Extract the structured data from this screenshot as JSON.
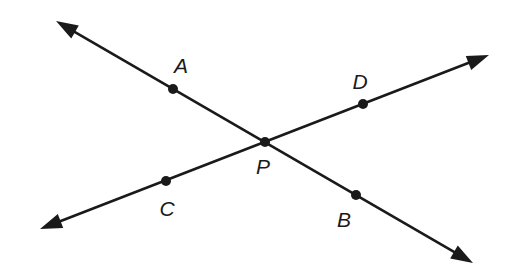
{
  "diagram": {
    "type": "intersecting-lines",
    "colors": {
      "line": "#1a1a1a",
      "background": "#ffffff"
    },
    "intersection": {
      "label": "P",
      "x": 265,
      "y": 142,
      "label_x": 263,
      "label_y": 165
    },
    "lines": [
      {
        "id": "line-AB",
        "name": "line AB",
        "start": {
          "x": 56,
          "y": 21
        },
        "end": {
          "x": 473,
          "y": 263
        },
        "arrow_start": true,
        "arrow_end": true
      },
      {
        "id": "line-CD",
        "name": "line CD",
        "start": {
          "x": 40,
          "y": 229
        },
        "end": {
          "x": 489,
          "y": 55
        },
        "arrow_start": true,
        "arrow_end": true
      }
    ],
    "points": [
      {
        "label": "A",
        "x": 173,
        "y": 89,
        "label_x": 181,
        "label_y": 65
      },
      {
        "label": "D",
        "x": 363,
        "y": 104,
        "label_x": 360,
        "label_y": 81
      },
      {
        "label": "P",
        "x": 265,
        "y": 142,
        "label_x": 263,
        "label_y": 166
      },
      {
        "label": "C",
        "x": 166,
        "y": 181,
        "label_x": 167,
        "label_y": 208
      },
      {
        "label": "B",
        "x": 356,
        "y": 195,
        "label_x": 344,
        "label_y": 219
      }
    ]
  }
}
